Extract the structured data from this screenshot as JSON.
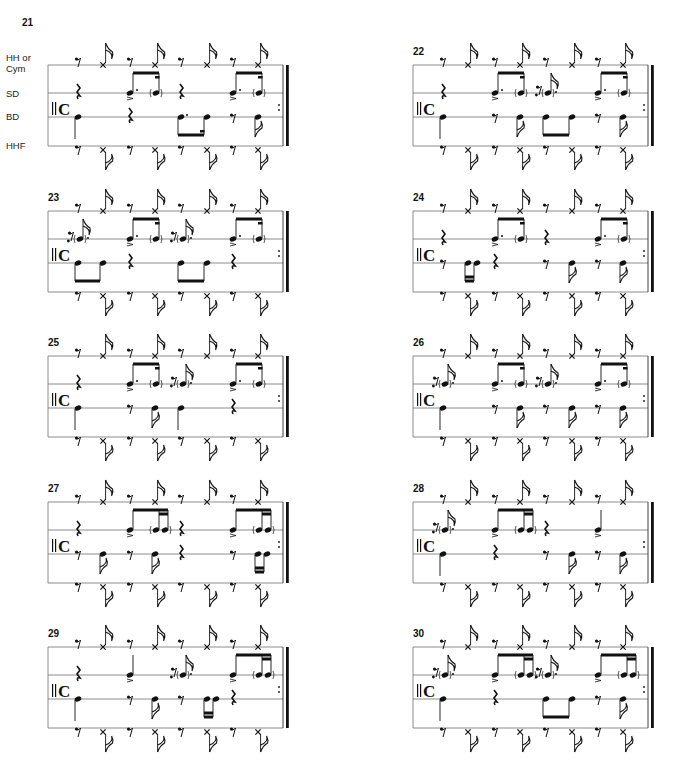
{
  "legend": {
    "voices": [
      "HH or Cym",
      "SD",
      "BD",
      "HHF"
    ],
    "hh_label_line1": "HH or",
    "hh_label_line2": "Cym",
    "sd_label": "SD",
    "bd_label": "BD",
    "hhf_label": "HHF"
  },
  "time_signature": "C",
  "layout": {
    "columns_x": [
      48,
      413
    ],
    "system_width": 243,
    "rows_top_y": [
      65,
      211,
      356,
      502,
      647
    ],
    "staff_line_offsets": [
      0,
      28,
      52,
      81
    ],
    "slot_offsets": [
      30,
      55,
      82,
      107,
      133,
      159,
      185,
      210
    ],
    "ink_color": "#111111",
    "line_color": "#6f6f6f"
  },
  "exercises": [
    {
      "number": "21",
      "col": 0,
      "row": 0,
      "show_labels": true,
      "hh": [
        "r8",
        "x8",
        "r8",
        "x8",
        "r8",
        "x8",
        "r8",
        "x8"
      ],
      "sd": [
        "qr",
        "",
        "n8d_acc",
        "n16g_beam",
        "qr",
        "",
        "n8d_acc",
        "n16g_beam"
      ],
      "bd": [
        "q",
        "",
        "qr",
        "",
        "n8d_beamb",
        "n16_beamb",
        "r8",
        "n8"
      ],
      "hhf": [
        "r8",
        "x8d",
        "r8",
        "x8d",
        "r8",
        "x8d",
        "r8",
        "x8d"
      ]
    },
    {
      "number": "22",
      "col": 1,
      "row": 0,
      "show_labels": false,
      "hh": [
        "r8",
        "x8",
        "r8",
        "x8",
        "r8",
        "x8",
        "r8",
        "x8"
      ],
      "sd": [
        "qr",
        "",
        "n8d_acc",
        "n16g_beam",
        "r16g8d",
        "",
        "n8d_acc",
        "n16g_beam"
      ],
      "bd": [
        "q",
        "",
        "r8",
        "n8",
        "n8_beamb",
        "n8_beamb",
        "r8",
        "n8"
      ],
      "hhf": [
        "r8",
        "x8d",
        "r8",
        "x8d",
        "r8",
        "x8d",
        "r8",
        "x8d"
      ]
    },
    {
      "number": "23",
      "col": 0,
      "row": 1,
      "show_labels": false,
      "hh": [
        "r8",
        "x8",
        "r8",
        "x8",
        "r8",
        "x8",
        "r8",
        "x8"
      ],
      "sd": [
        "r16g8d",
        "",
        "n8d_acc",
        "n16g_beam",
        "r16g8d",
        "",
        "n8d_acc",
        "n16g_beam"
      ],
      "bd": [
        "n8_beamb",
        "n8_beamb",
        "qr",
        "",
        "n8_beamb",
        "n8_beamb",
        "qr",
        ""
      ],
      "hhf": [
        "r8",
        "x8d",
        "r8",
        "x8d",
        "r8",
        "x8d",
        "r8",
        "x8d"
      ]
    },
    {
      "number": "24",
      "col": 1,
      "row": 1,
      "show_labels": false,
      "hh": [
        "r8",
        "x8",
        "r8",
        "x8",
        "r8",
        "x8",
        "r8",
        "x8"
      ],
      "sd": [
        "qr",
        "",
        "n8d_acc",
        "n16g_beam",
        "qr",
        "",
        "n8d_acc",
        "n16g_beam"
      ],
      "bd": [
        "r8",
        "n16pair",
        "qr",
        "",
        "r8",
        "n8",
        "r8",
        "n8"
      ],
      "hhf": [
        "r8",
        "x8d",
        "r8",
        "x8d",
        "r8",
        "x8d",
        "r8",
        "x8d"
      ]
    },
    {
      "number": "25",
      "col": 0,
      "row": 2,
      "show_labels": false,
      "hh": [
        "r8",
        "x8",
        "r8",
        "x8",
        "r8",
        "x8",
        "r8",
        "x8"
      ],
      "sd": [
        "qr",
        "",
        "n8d_acc",
        "n16g_beam",
        "r16g8d",
        "",
        "n8d_acc",
        "n16g_beam"
      ],
      "bd": [
        "q",
        "",
        "r8",
        "n8",
        "q",
        "",
        "qr",
        ""
      ],
      "hhf": [
        "r8",
        "x8d",
        "r8",
        "x8d",
        "r8",
        "x8d",
        "r8",
        "x8d"
      ]
    },
    {
      "number": "26",
      "col": 1,
      "row": 2,
      "show_labels": false,
      "hh": [
        "r8",
        "x8",
        "r8",
        "x8",
        "r8",
        "x8",
        "r8",
        "x8"
      ],
      "sd": [
        "r16g8d",
        "",
        "n8d_acc",
        "n16g_beam",
        "r16g8d",
        "",
        "n8d_acc",
        "n16g_beam"
      ],
      "bd": [
        "q",
        "",
        "r8",
        "n8",
        "r8",
        "n8",
        "r8",
        "n8"
      ],
      "hhf": [
        "r8",
        "x8d",
        "r8",
        "x8d",
        "r8",
        "x8d",
        "r8",
        "x8d"
      ]
    },
    {
      "number": "27",
      "col": 0,
      "row": 3,
      "show_labels": false,
      "hh": [
        "r8",
        "x8",
        "r8",
        "x8",
        "r8",
        "x8",
        "r8",
        "x8"
      ],
      "sd": [
        "qr",
        "",
        "n8_acc_b",
        "g16pair",
        "qr",
        "",
        "n8_acc_b",
        "g16pair"
      ],
      "bd": [
        "r8",
        "n8",
        "r8",
        "n8",
        "qr",
        "",
        "r8",
        "n16pair"
      ],
      "hhf": [
        "r8",
        "x8d",
        "r8",
        "x8d",
        "r8",
        "x8d",
        "r8",
        "x8d"
      ]
    },
    {
      "number": "28",
      "col": 1,
      "row": 3,
      "show_labels": false,
      "hh": [
        "r8",
        "x8",
        "r8",
        "x8",
        "r8",
        "x8",
        "r8",
        "x8"
      ],
      "sd": [
        "r16g8d",
        "",
        "n8_acc_b",
        "g16pair",
        "qr",
        "",
        "q_acc",
        ""
      ],
      "bd": [
        "q",
        "",
        "qr",
        "",
        "r8",
        "n8",
        "r8",
        "n8"
      ],
      "hhf": [
        "r8",
        "x8d",
        "r8",
        "x8d",
        "r8",
        "x8d",
        "r8",
        "x8d"
      ]
    },
    {
      "number": "29",
      "col": 0,
      "row": 4,
      "show_labels": false,
      "hh": [
        "r8",
        "x8",
        "r8",
        "x8",
        "r8",
        "x8",
        "r8",
        "x8"
      ],
      "sd": [
        "qr",
        "",
        "q_acc",
        "",
        "r16g8d",
        "",
        "n8_acc_b",
        "g16pair"
      ],
      "bd": [
        "q",
        "",
        "r8",
        "n8",
        "r8",
        "n16pair",
        "qr",
        ""
      ],
      "hhf": [
        "r8",
        "x8d",
        "r8",
        "x8d",
        "r8",
        "x8d",
        "r8",
        "x8d"
      ]
    },
    {
      "number": "30",
      "col": 1,
      "row": 4,
      "show_labels": false,
      "hh": [
        "r8",
        "x8",
        "r8",
        "x8",
        "r8",
        "x8",
        "r8",
        "x8"
      ],
      "sd": [
        "r16g8d",
        "",
        "n8_acc_b",
        "g16pair",
        "r16g8d",
        "",
        "n8_acc_b",
        "g16pair"
      ],
      "bd": [
        "q",
        "",
        "qr",
        "",
        "n8_beamb",
        "n8_beamb",
        "r8",
        "n8"
      ],
      "hhf": [
        "r8",
        "x8d",
        "r8",
        "x8d",
        "r8",
        "x8d",
        "r8",
        "x8d"
      ]
    }
  ]
}
